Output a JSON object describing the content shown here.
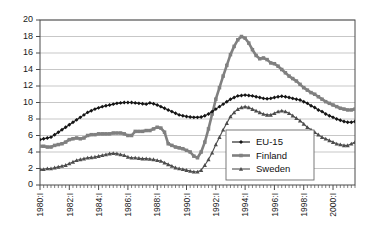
{
  "chart_data": {
    "type": "line",
    "title": "",
    "subtitle": "",
    "xlabel": "",
    "ylabel": "",
    "ylim": [
      0,
      20
    ],
    "ytick_step": 2,
    "ytick_labels": [
      "0",
      "2",
      "4",
      "6",
      "8",
      "10",
      "12",
      "14",
      "16",
      "18",
      "20"
    ],
    "grid": true,
    "grid_axis": "y",
    "legend_position": "center-right-inside",
    "x_label_format": "YYYY:I",
    "x_tick_labels": [
      "1980:I",
      "1982:I",
      "1984:I",
      "1986:I",
      "1988:I",
      "1990:I",
      "1992:I",
      "1994:I",
      "1996:I",
      "1998:I",
      "2000:I"
    ],
    "x_labeled_indices": [
      0,
      8,
      16,
      24,
      32,
      40,
      48,
      56,
      64,
      72,
      80
    ],
    "x_minor_ticks_per_label": 8,
    "x_categories": [
      "1980:I",
      "1980:II",
      "1980:III",
      "1980:IV",
      "1981:I",
      "1981:II",
      "1981:III",
      "1981:IV",
      "1982:I",
      "1982:II",
      "1982:III",
      "1982:IV",
      "1983:I",
      "1983:II",
      "1983:III",
      "1983:IV",
      "1984:I",
      "1984:II",
      "1984:III",
      "1984:IV",
      "1985:I",
      "1985:II",
      "1985:III",
      "1985:IV",
      "1986:I",
      "1986:II",
      "1986:III",
      "1986:IV",
      "1987:I",
      "1987:II",
      "1987:III",
      "1987:IV",
      "1988:I",
      "1988:II",
      "1988:III",
      "1988:IV",
      "1989:I",
      "1989:II",
      "1989:III",
      "1989:IV",
      "1990:I",
      "1990:II",
      "1990:III",
      "1990:IV",
      "1991:I",
      "1991:II",
      "1991:III",
      "1991:IV",
      "1992:I",
      "1992:II",
      "1992:III",
      "1992:IV",
      "1993:I",
      "1993:II",
      "1993:III",
      "1993:IV",
      "1994:I",
      "1994:II",
      "1994:III",
      "1994:IV",
      "1995:I",
      "1995:II",
      "1995:III",
      "1995:IV",
      "1996:I",
      "1996:II",
      "1996:III",
      "1996:IV",
      "1997:I",
      "1997:II",
      "1997:III",
      "1997:IV",
      "1998:I",
      "1998:II",
      "1998:III",
      "1998:IV",
      "1999:I",
      "1999:II",
      "1999:III",
      "1999:IV",
      "2000:I",
      "2000:II",
      "2000:III",
      "2000:IV",
      "2001:I",
      "2001:II",
      "2001:III"
    ],
    "series": [
      {
        "name": "EU-15",
        "color": "#151515",
        "marker": "diamond",
        "line_width": 1.1,
        "values": [
          5.5,
          5.6,
          5.7,
          5.8,
          6.1,
          6.4,
          6.7,
          7.0,
          7.3,
          7.6,
          7.9,
          8.2,
          8.5,
          8.8,
          9.0,
          9.2,
          9.35,
          9.5,
          9.6,
          9.7,
          9.8,
          9.9,
          9.95,
          10.0,
          10.0,
          10.0,
          9.95,
          9.9,
          9.85,
          9.8,
          9.95,
          9.85,
          9.7,
          9.5,
          9.3,
          9.1,
          8.9,
          8.7,
          8.5,
          8.4,
          8.3,
          8.25,
          8.2,
          8.2,
          8.25,
          8.4,
          8.6,
          8.9,
          9.2,
          9.5,
          9.8,
          10.1,
          10.4,
          10.6,
          10.8,
          10.85,
          10.9,
          10.85,
          10.8,
          10.7,
          10.6,
          10.5,
          10.45,
          10.5,
          10.6,
          10.7,
          10.75,
          10.7,
          10.6,
          10.5,
          10.4,
          10.3,
          10.1,
          9.9,
          9.6,
          9.4,
          9.1,
          8.9,
          8.6,
          8.4,
          8.2,
          8.0,
          7.85,
          7.7,
          7.6,
          7.6,
          7.7
        ]
      },
      {
        "name": "Finland",
        "color": "#808080",
        "marker": "square",
        "line_width": 2.6,
        "values": [
          4.7,
          4.7,
          4.6,
          4.6,
          4.8,
          4.9,
          5.0,
          5.2,
          5.5,
          5.6,
          5.7,
          5.6,
          5.7,
          6.0,
          6.1,
          6.1,
          6.2,
          6.2,
          6.2,
          6.2,
          6.3,
          6.3,
          6.3,
          6.2,
          6.0,
          6.0,
          6.5,
          6.5,
          6.5,
          6.6,
          6.6,
          6.8,
          7.0,
          6.9,
          6.4,
          5.0,
          4.8,
          4.6,
          4.5,
          4.4,
          4.2,
          4.0,
          3.5,
          3.3,
          4.0,
          5.2,
          6.8,
          8.6,
          10.4,
          11.8,
          13.2,
          14.5,
          15.8,
          16.8,
          17.6,
          18.0,
          17.8,
          17.2,
          16.4,
          15.7,
          15.3,
          15.4,
          15.2,
          14.8,
          14.7,
          14.4,
          14.0,
          13.6,
          13.2,
          12.9,
          12.6,
          12.2,
          11.8,
          11.5,
          11.2,
          11.0,
          10.7,
          10.4,
          10.1,
          9.9,
          9.7,
          9.5,
          9.3,
          9.2,
          9.1,
          9.1,
          9.2
        ]
      },
      {
        "name": "Sweden",
        "color": "#4d4d4d",
        "marker": "triangle",
        "line_width": 1.1,
        "values": [
          1.9,
          1.9,
          2.0,
          2.0,
          2.1,
          2.2,
          2.3,
          2.4,
          2.6,
          2.8,
          3.0,
          3.1,
          3.2,
          3.3,
          3.35,
          3.4,
          3.5,
          3.6,
          3.7,
          3.8,
          3.85,
          3.8,
          3.7,
          3.6,
          3.4,
          3.3,
          3.3,
          3.25,
          3.2,
          3.2,
          3.15,
          3.1,
          3.0,
          2.9,
          2.7,
          2.5,
          2.3,
          2.1,
          2.0,
          1.9,
          1.8,
          1.7,
          1.6,
          1.6,
          1.8,
          2.4,
          3.1,
          3.9,
          4.9,
          5.8,
          6.7,
          7.5,
          8.3,
          8.8,
          9.2,
          9.4,
          9.5,
          9.4,
          9.2,
          9.0,
          8.8,
          8.6,
          8.5,
          8.5,
          8.7,
          8.9,
          9.0,
          8.9,
          8.7,
          8.4,
          8.1,
          7.8,
          7.4,
          7.0,
          6.7,
          6.4,
          6.1,
          5.8,
          5.6,
          5.4,
          5.2,
          5.0,
          4.9,
          4.8,
          4.8,
          5.0,
          5.2
        ]
      }
    ]
  },
  "legend": {
    "items": [
      {
        "label": "EU-15"
      },
      {
        "label": "Finland"
      },
      {
        "label": "Sweden"
      }
    ]
  }
}
